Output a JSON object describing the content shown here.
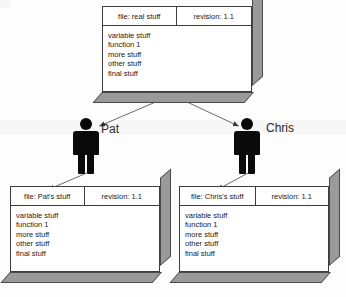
{
  "diagram": {
    "title_visible": false,
    "colors": {
      "box_face": "#ffffff",
      "box_side": "#9a9a9a",
      "outline": "#3d3d3d",
      "figure": "#0a0a0a",
      "arrow": "#4a4a4a",
      "background": "#fdfdfd"
    },
    "body_lines": [
      "variable stuff",
      "function 1",
      "more stuff",
      "other stuff",
      "final stuff"
    ],
    "boxes": [
      {
        "id": "repository",
        "file_label": "file: real stuff",
        "revision_label": "revision: 1.1",
        "lines": [
          "variable stuff",
          "function 1",
          "more stuff",
          "other stuff",
          "final stuff"
        ]
      },
      {
        "id": "pat-working-copy",
        "file_label": "file: Pat's stuff",
        "revision_label": "revision: 1.1",
        "lines": [
          "variable stuff",
          "function 1",
          "more stuff",
          "other stuff",
          "final stuff"
        ]
      },
      {
        "id": "chris-working-copy",
        "file_label": "file: Chris's stuff",
        "revision_label": "revision: 1.1",
        "lines": [
          "variable stuff",
          "function 1",
          "more stuff",
          "other stuff",
          "final stuff"
        ]
      }
    ],
    "people": [
      {
        "id": "pat",
        "label": "Pat",
        "icon": "person-icon"
      },
      {
        "id": "chris",
        "label": "Chris",
        "icon": "person-icon"
      }
    ],
    "arrows": [
      {
        "id": "repo-to-pat",
        "from": "repository",
        "to": "pat"
      },
      {
        "id": "repo-to-chris",
        "from": "repository",
        "to": "chris"
      },
      {
        "id": "pat-to-pat-copy",
        "from": "pat",
        "to": "pat-working-copy"
      },
      {
        "id": "chris-to-chris-copy",
        "from": "chris",
        "to": "chris-working-copy"
      }
    ]
  }
}
